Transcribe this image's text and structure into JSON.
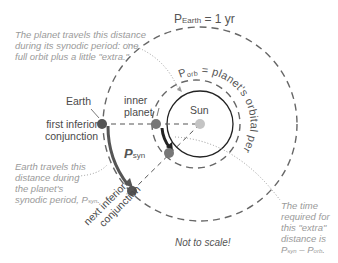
{
  "diagram": {
    "title_earth_period": {
      "main": "P",
      "sub": "Earth",
      "rest": " = 1 yr"
    },
    "orbital_period_label": {
      "main": "P",
      "sub": "orb",
      "rest": " = planet's orbital period"
    },
    "planet_distance_note": [
      "The planet travels this distance",
      "during its synodic period: one",
      "full orbit plus a little \"extra.\""
    ],
    "earth_distance_note": [
      "Earth travels this",
      "distance during",
      "the planet's",
      "synodic period, P"
    ],
    "earth_distance_note_sub": "syn",
    "extra_time_note": [
      "The time",
      "required for",
      "this \"extra\"",
      "distance is"
    ],
    "extra_time_formula": {
      "a": "P",
      "a_sub": "syn",
      "op": " – ",
      "b": "P",
      "b_sub": "orb",
      "end": "."
    },
    "earth_label": "Earth",
    "inner_planet_label": [
      "inner",
      "planet"
    ],
    "sun_label": "Sun",
    "first_conjunction_label": [
      "first inferior",
      "conjunction"
    ],
    "next_conjunction_label": [
      "next inferior",
      "conjunction"
    ],
    "psyn_label": {
      "main": "P",
      "sub": "syn"
    },
    "not_to_scale": "Not to scale!",
    "colors": {
      "earth": "#555555",
      "inner_planet": "#777777",
      "sun": "#c4c4c4",
      "orbit_dash": "#666666",
      "inner_orbit": "#222222",
      "note_gray": "#9a9a9a"
    }
  }
}
